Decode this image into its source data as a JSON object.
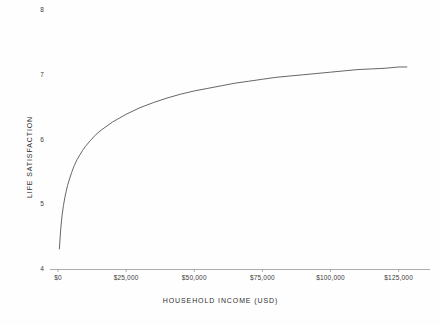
{
  "chart_data": {
    "type": "line",
    "title": "",
    "subtitle": "",
    "xlabel": "HOUSEHOLD INCOME  (USD)",
    "ylabel": "LIFE SATISFACTION",
    "xlim": [
      0,
      131000
    ],
    "ylim": [
      4,
      8
    ],
    "grid": false,
    "legend": null,
    "xticks": [
      0,
      25000,
      50000,
      75000,
      100000,
      125000
    ],
    "xticklabels": [
      "$0",
      "$25,000",
      "$50,000",
      "$75,000",
      "$100,000",
      "$125,000"
    ],
    "yticks": [
      4,
      5,
      6,
      7,
      8
    ],
    "yticklabels": [
      "4",
      "5",
      "6",
      "7",
      "8"
    ],
    "series": [
      {
        "name": "life satisfaction vs income",
        "color": "#555555",
        "x": [
          500,
          1000,
          1500,
          2000,
          2500,
          3000,
          3500,
          4000,
          5000,
          6000,
          7000,
          8000,
          9000,
          10000,
          12000,
          14000,
          16000,
          18000,
          20000,
          25000,
          30000,
          35000,
          40000,
          45000,
          50000,
          55000,
          60000,
          65000,
          70000,
          75000,
          80000,
          85000,
          90000,
          95000,
          100000,
          105000,
          110000,
          115000,
          120000,
          125000,
          128000
        ],
        "y": [
          4.31,
          4.62,
          4.83,
          4.98,
          5.1,
          5.2,
          5.29,
          5.36,
          5.49,
          5.6,
          5.69,
          5.76,
          5.83,
          5.89,
          5.99,
          6.08,
          6.15,
          6.21,
          6.27,
          6.39,
          6.49,
          6.57,
          6.64,
          6.7,
          6.75,
          6.79,
          6.83,
          6.87,
          6.9,
          6.93,
          6.96,
          6.98,
          7.0,
          7.02,
          7.04,
          7.06,
          7.08,
          7.09,
          7.1,
          7.12,
          7.12
        ]
      }
    ]
  },
  "axes": {
    "y_title": "LIFE SATISFACTION",
    "x_title": "HOUSEHOLD INCOME  (USD)"
  }
}
